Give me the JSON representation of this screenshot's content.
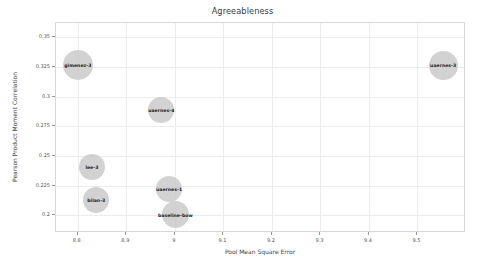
{
  "chart_data": {
    "type": "scatter",
    "title": "Agreeableness",
    "xlabel": "Pool Mean Square Error",
    "ylabel": "Pearson Product Moment Correlation",
    "xlim": [
      8.755,
      9.6
    ],
    "ylim": [
      0.185,
      0.362
    ],
    "xticks": [
      "8.8",
      "8.9",
      "9",
      "9.1",
      "9.2",
      "9.3",
      "9.4",
      "9.5"
    ],
    "xtick_values": [
      8.8,
      8.9,
      9.0,
      9.1,
      9.2,
      9.3,
      9.4,
      9.5
    ],
    "yticks": [
      "0.35",
      "0.325",
      "0.3",
      "0.275",
      "0.25",
      "0.225",
      "0.2"
    ],
    "ytick_values": [
      0.35,
      0.325,
      0.3,
      0.275,
      0.25,
      0.225,
      0.2
    ],
    "grid": true,
    "legend": "none",
    "bubble_color": "#c8c8c8",
    "points": [
      {
        "label": "gimenez-3",
        "x": 8.8,
        "y": 0.327,
        "size": 30
      },
      {
        "label": "uaernes-3",
        "x": 9.553,
        "y": 0.3265,
        "size": 29
      },
      {
        "label": "uaernes-4",
        "x": 8.972,
        "y": 0.289,
        "size": 26
      },
      {
        "label": "lee-3",
        "x": 8.829,
        "y": 0.241,
        "size": 26
      },
      {
        "label": "bilan-3",
        "x": 8.838,
        "y": 0.2128,
        "size": 26
      },
      {
        "label": "uaernes-1",
        "x": 8.988,
        "y": 0.2222,
        "size": 26
      },
      {
        "label": "baseline-bow",
        "x": 9.001,
        "y": 0.2003,
        "size": 27
      }
    ]
  }
}
